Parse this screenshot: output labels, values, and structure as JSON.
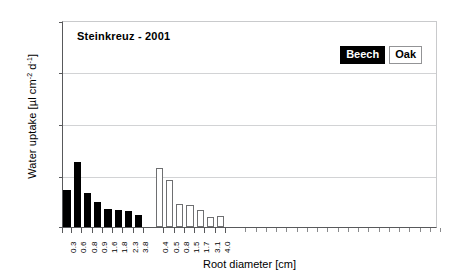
{
  "chart_data": {
    "type": "bar",
    "title": "Steinkreuz - 2001",
    "xlabel": "Root diameter [cm]",
    "ylabel_parts": {
      "pre": "Water uptake [µl cm",
      "sup1": "-2",
      "mid": " d",
      "sup2": "-1",
      "post": "]"
    },
    "ylabel": "Water uptake [µl cm-2 d-1]",
    "ylim": [
      0,
      20
    ],
    "yticks": [
      0,
      5,
      10,
      15,
      20
    ],
    "ytick_labels": [
      "0",
      "5",
      "10",
      "15",
      "20"
    ],
    "grid": true,
    "grid_axis": "y",
    "legend_position": "top-right",
    "series": [
      {
        "name": "Beech",
        "color": "#000000",
        "fill": "solid",
        "categories": [
          "0.3",
          "0.6",
          "0.8",
          "0.9",
          "1.6",
          "1.8",
          "2.3",
          "3.8"
        ],
        "values": [
          3.6,
          6.3,
          3.25,
          2.4,
          1.7,
          1.6,
          1.55,
          1.2
        ]
      },
      {
        "name": "Oak",
        "color": "#ffffff",
        "fill": "hollow",
        "categories": [
          "0.4",
          "0.5",
          "0.8",
          "1.5",
          "1.7",
          "3.1",
          "4.0"
        ],
        "values": [
          5.7,
          4.55,
          2.25,
          2.1,
          1.6,
          1.0,
          1.05
        ]
      }
    ],
    "empty_tick_count": 23
  },
  "legend": {
    "items": [
      {
        "label": "Beech",
        "style": "filled-black"
      },
      {
        "label": "Oak",
        "style": "outline-white"
      }
    ]
  },
  "colors": {
    "axis": "#58595b",
    "grid": "#d2d3d5",
    "beech": "#000000",
    "oak_border": "#6e6f71",
    "background": "#ffffff"
  }
}
